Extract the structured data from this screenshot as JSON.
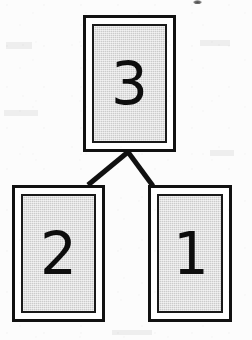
{
  "diagram": {
    "kind": "binary-tree",
    "background_color": "#fcfcfc",
    "node_fill_color": "#cbcbcb",
    "node_border_color": "#111111",
    "edge_color": "#111111",
    "nodes": [
      {
        "id": "root",
        "label": "3",
        "role": "root-node",
        "x": 83,
        "y": 15,
        "width": 93,
        "height": 137
      },
      {
        "id": "left",
        "label": "2",
        "role": "left-child-node",
        "x": 12,
        "y": 185,
        "width": 93,
        "height": 137
      },
      {
        "id": "right",
        "label": "1",
        "role": "right-child-node",
        "x": 148,
        "y": 185,
        "width": 84,
        "height": 137
      }
    ],
    "edges": [
      {
        "id": "root-to-left",
        "from": "root",
        "to": "left",
        "x1": 128,
        "y1": 152,
        "x2": 88,
        "y2": 185,
        "stroke_width": 5
      },
      {
        "id": "root-to-right",
        "from": "root",
        "to": "right",
        "x1": 128,
        "y1": 152,
        "x2": 153,
        "y2": 186,
        "stroke_width": 5
      }
    ],
    "artifacts": [
      {
        "id": "top-smudge",
        "kind": "scan-smudge",
        "x": 193,
        "y": 0,
        "width": 9,
        "height": 4
      }
    ]
  }
}
